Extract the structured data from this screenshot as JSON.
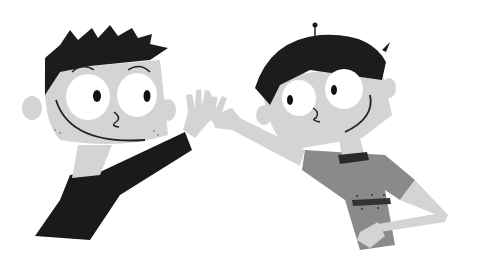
{
  "image": {
    "description": "Grayscale cartoon illustration of two boys giving each other a high five",
    "style": "flat vector, grayscale",
    "background": "#ffffff",
    "colors": {
      "hair": "#1c1c1c",
      "skin": "#d4d4d4",
      "skin_shadow": "#bdbdbd",
      "eye_white": "#ffffff",
      "pupil": "#111111",
      "left_shirt": "#1a1a1a",
      "right_shirt": "#8a8a8a",
      "collar": "#2a2a2a",
      "belt": "#333333",
      "line": "#222222"
    },
    "figures": [
      {
        "name": "left-boy",
        "hair": "spiky black",
        "shirt": "black long-sleeve",
        "pose": "raising right hand for high five, smiling"
      },
      {
        "name": "right-boy",
        "hair": "black bowl cut with antenna tuft",
        "shirt": "gray short-sleeve with belt",
        "pose": "raising left hand for high five, other hand on hip"
      }
    ]
  }
}
